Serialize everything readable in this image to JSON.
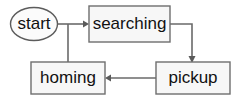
{
  "diagram": {
    "type": "state-transition-diagram",
    "background_color": "#ffffff",
    "node_fill_color": "#f7f7f7",
    "node_border_color": "#6e6e6e",
    "edge_color": "#6a6a6a",
    "text_color": "#111111",
    "nodes": [
      {
        "id": "start",
        "label": "start",
        "shape": "ellipse",
        "cx": 34,
        "cy": 24,
        "rx": 23.5,
        "ry": 16.5
      },
      {
        "id": "searching",
        "label": "searching",
        "shape": "rectangle",
        "x": 89,
        "y": 6,
        "width": 81,
        "height": 36
      },
      {
        "id": "homing",
        "label": "homing",
        "shape": "rectangle",
        "x": 31,
        "y": 62,
        "width": 74,
        "height": 32
      },
      {
        "id": "pickup",
        "label": "pickup",
        "shape": "rectangle",
        "x": 156,
        "y": 62,
        "width": 74,
        "height": 32
      }
    ],
    "edges": [
      {
        "id": "start-to-searching",
        "from": "start",
        "to": "searching",
        "arrowhead": true,
        "path": "M 58 24 L 86 24"
      },
      {
        "id": "start-to-homing",
        "from": "start",
        "to": "homing",
        "arrowhead": false,
        "path": "M 68 24 L 68 62"
      },
      {
        "id": "searching-to-pickup",
        "from": "searching",
        "to": "pickup",
        "arrowhead": true,
        "path": "M 170 24 L 192 24 L 192 59"
      },
      {
        "id": "pickup-to-homing",
        "from": "pickup",
        "to": "homing",
        "arrowhead": true,
        "path": "M 156 78 L 108 78"
      }
    ]
  }
}
